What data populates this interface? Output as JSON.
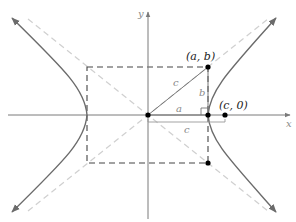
{
  "diagram": {
    "type": "hyperbola-geometry",
    "axes": {
      "x_label": "x",
      "y_label": "y"
    },
    "points": {
      "vertex_ab": {
        "label": "(a, b)"
      },
      "focus": {
        "label": "(c, 0)"
      }
    },
    "segment_labels": {
      "hypotenuse": "c",
      "vertical": "b",
      "horizontal": "a",
      "brace": "c"
    },
    "colors": {
      "axis": "#7a7a7a",
      "hyperbola": "#6b6b6b",
      "asymptote": "#cfcfcf",
      "box": "#444444",
      "point": "#000000"
    }
  }
}
